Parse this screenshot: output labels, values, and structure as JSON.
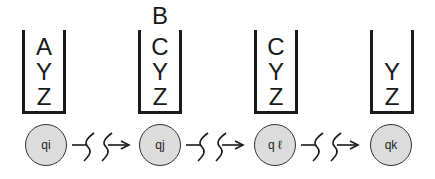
{
  "diagram": {
    "type": "pushdown-automaton-computation",
    "stacks": [
      {
        "items": [
          "A",
          "Y",
          "Z"
        ],
        "overflow": null
      },
      {
        "items": [
          "C",
          "Y",
          "Z"
        ],
        "overflow": "B"
      },
      {
        "items": [
          "C",
          "Y",
          "Z"
        ],
        "overflow": null
      },
      {
        "items": [
          "Y",
          "Z"
        ],
        "overflow": null
      }
    ],
    "states": [
      {
        "label": "qi"
      },
      {
        "label": "qj"
      },
      {
        "label": "q ℓ"
      },
      {
        "label": "qk"
      }
    ],
    "transitions": [
      {
        "from": "qi",
        "to": "qj",
        "style": "zigzag-arrow"
      },
      {
        "from": "qj",
        "to": "q ℓ",
        "style": "zigzag-arrow"
      },
      {
        "from": "q ℓ",
        "to": "qk",
        "style": "zigzag-arrow"
      }
    ],
    "colors": {
      "state_fill": "#dcdcdc",
      "stroke": "#1a1a1a"
    }
  }
}
